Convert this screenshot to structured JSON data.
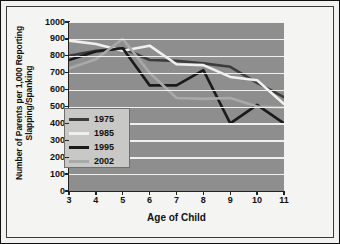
{
  "chart_data": {
    "type": "line",
    "title": "",
    "xlabel": "Age of Child",
    "ylabel": "Number of Parents per 1,000 Reporting Slapping/Spanking",
    "x": [
      3,
      4,
      5,
      6,
      7,
      8,
      9,
      10,
      11
    ],
    "xtick_labels": [
      "3",
      "4",
      "5",
      "6",
      "7",
      "8",
      "9",
      "10",
      "11"
    ],
    "ytick_labels": [
      "0",
      "100",
      "200",
      "300",
      "400",
      "500",
      "600",
      "700",
      "800",
      "900",
      "1000"
    ],
    "yticks": [
      0,
      100,
      200,
      300,
      400,
      500,
      600,
      700,
      800,
      900,
      1000
    ],
    "ylim": [
      0,
      1000
    ],
    "xlim": [
      3,
      11
    ],
    "grid": "horizontal",
    "legend_position": "inside-left",
    "series": [
      {
        "name": "1975",
        "color": "#3c3c3c",
        "values": [
          800,
          830,
          845,
          775,
          770,
          755,
          735,
          640,
          555
        ]
      },
      {
        "name": "1985",
        "color": "#f0f0ee",
        "values": [
          890,
          870,
          830,
          860,
          750,
          745,
          675,
          655,
          515
        ]
      },
      {
        "name": "1995",
        "color": "#1a1a1a",
        "values": [
          775,
          825,
          845,
          625,
          625,
          715,
          400,
          510,
          400
        ]
      },
      {
        "name": "2002",
        "color": "#a9a9a9",
        "values": [
          725,
          780,
          900,
          700,
          550,
          545,
          550,
          500,
          495
        ]
      }
    ]
  },
  "legend": {
    "items": [
      {
        "label": "1975",
        "color": "#3c3c3c"
      },
      {
        "label": "1985",
        "color": "#f0f0ee"
      },
      {
        "label": "1995",
        "color": "#1a1a1a"
      },
      {
        "label": "2002",
        "color": "#a9a9a9"
      }
    ]
  }
}
